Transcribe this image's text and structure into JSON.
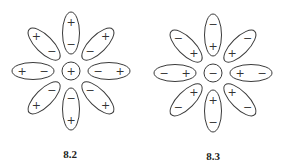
{
  "figures": [
    {
      "label": "8.2",
      "center": {
        "x": 71,
        "y": 71,
        "r": 9,
        "sign": "+"
      },
      "petal_inner_sign": "−",
      "petal_outer_sign": "+",
      "petals": [
        {
          "angle": -90,
          "inner": "−",
          "outer": "+"
        },
        {
          "angle": -45,
          "inner": "−",
          "outer": "+"
        },
        {
          "angle": 0,
          "inner": "−",
          "outer": "+"
        },
        {
          "angle": 45,
          "inner": "−",
          "outer": "+"
        },
        {
          "angle": 90,
          "inner": "−",
          "outer": "+"
        },
        {
          "angle": 135,
          "inner": "−",
          "outer": "+"
        },
        {
          "angle": 180,
          "inner": "−",
          "outer": "+"
        },
        {
          "angle": 225,
          "inner": "−",
          "outer": "+"
        }
      ]
    },
    {
      "label": "8.3",
      "center": {
        "x": 213,
        "y": 73,
        "r": 9,
        "sign": "−"
      },
      "petal_inner_sign": "+",
      "petal_outer_sign": "−",
      "petals": [
        {
          "angle": -90,
          "inner": "+",
          "outer": "−"
        },
        {
          "angle": -45,
          "inner": "+",
          "outer": "−"
        },
        {
          "angle": 0,
          "inner": "+",
          "outer": "−"
        },
        {
          "angle": 45,
          "inner": "+",
          "outer": "−"
        },
        {
          "angle": 90,
          "inner": "+",
          "outer": "−"
        },
        {
          "angle": 135,
          "inner": "+",
          "outer": "−"
        },
        {
          "angle": 180,
          "inner": "+",
          "outer": "−"
        },
        {
          "angle": 225,
          "inner": "+",
          "outer": "−"
        }
      ]
    }
  ]
}
